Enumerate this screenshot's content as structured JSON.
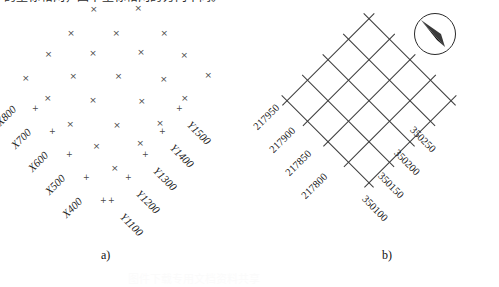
{
  "header": {
    "cropped_text": "的坐标格网，图中坐标格网的方向不同。"
  },
  "panel_a": {
    "caption": "a)",
    "x_labels": [
      "X800",
      "X700",
      "X600",
      "X500",
      "X400"
    ],
    "y_labels": [
      "Y1100",
      "Y1200",
      "Y1300",
      "Y1400",
      "Y1500"
    ],
    "marker_glyph": "×",
    "tick_glyph": "+",
    "rows": 5,
    "cols": 5,
    "rotation_deg": 45
  },
  "panel_b": {
    "caption": "b)",
    "northing_labels": [
      "217950",
      "217900",
      "217850",
      "217800"
    ],
    "easting_labels": [
      "350100",
      "350150",
      "350200",
      "350250"
    ],
    "grid_lines": 5,
    "grid_cells": 4,
    "rotation_deg": 45,
    "compass": {
      "name": "north-arrow",
      "bearing_deg": -35
    }
  },
  "watermark": {
    "text": "图件下载专用文档资料共享"
  },
  "colors": {
    "ink": "#1a1a1a",
    "marker": "#4a4a4a",
    "grid": "#3b3b3b",
    "background": "#ffffff",
    "watermark": "#fbfbfb"
  }
}
